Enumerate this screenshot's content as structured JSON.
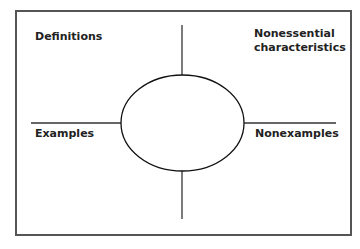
{
  "diagram": {
    "type": "frayer-model",
    "quadrants": {
      "top_left": "Definitions",
      "top_right_line1": "Nonessential",
      "top_right_line2": "characteristics",
      "bottom_left": "Examples",
      "bottom_right": "Nonexamples"
    },
    "center_oval_text": ""
  }
}
